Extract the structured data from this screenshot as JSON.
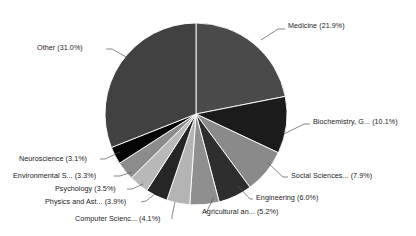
{
  "chart_data": {
    "type": "pie",
    "title": "",
    "subtitle": "",
    "xlabel": "",
    "ylabel": "",
    "legend_position": "none",
    "grid": false,
    "label_format": "{name} ({value}%)",
    "start_angle_deg": 0,
    "direction": "clockwise",
    "categories": [
      "Medicine",
      "Biochemistry, G...",
      "Social Sciences...",
      "Engineering",
      "Agricultural an...",
      "Computer Scienc...",
      "Physics and Ast...",
      "Psychology",
      "Environmental S...",
      "Neuroscience",
      "Other"
    ],
    "values": [
      21.9,
      10.1,
      7.9,
      6.0,
      5.2,
      4.1,
      3.9,
      3.5,
      3.3,
      3.1,
      31.0
    ],
    "colors": [
      "#4a4a4a",
      "#1b1b1b",
      "#8a8a8a",
      "#2e2e2e",
      "#8f8f8f",
      "#b4b4b4",
      "#262626",
      "#b9b9b9",
      "#8c8c8c",
      "#050505",
      "#414141"
    ],
    "slices": [
      {
        "name": "Medicine",
        "value": 21.9,
        "label": "Medicine (21.9%)",
        "color": "#4a4a4a",
        "label_x": 288,
        "label_y": 28,
        "anchor": "start",
        "leader": "261,40 278,29 285,29"
      },
      {
        "name": "Biochemistry, G...",
        "value": 10.1,
        "label": "Biochemistry, G... (10.1%)",
        "color": "#1b1b1b",
        "label_x": 313,
        "label_y": 124,
        "anchor": "start",
        "leader": "284,134 304,124 310,124"
      },
      {
        "name": "Social Sciences...",
        "value": 7.9,
        "label": "Social Sciences... (7.9%)",
        "color": "#8a8a8a",
        "label_x": 291,
        "label_y": 178,
        "anchor": "start",
        "leader": "268,163 283,177 288,177"
      },
      {
        "name": "Engineering",
        "value": 6.0,
        "label": "Engineering (6.0%)",
        "color": "#2e2e2e",
        "label_x": 256,
        "label_y": 200,
        "anchor": "start",
        "leader": "238,186 250,199 253,199"
      },
      {
        "name": "Agricultural an...",
        "value": 5.2,
        "label": "Agricultural an... (5.2%)",
        "color": "#8f8f8f",
        "label_x": 202,
        "label_y": 214,
        "anchor": "start",
        "leader": "214,197 207,211 205,213"
      },
      {
        "name": "Computer Scienc...",
        "value": 4.1,
        "label": "Computer Scienc... (4.1%)",
        "color": "#b4b4b4",
        "label_x": 75,
        "label_y": 221,
        "anchor": "start",
        "leader": "175,202 172,216 172,219"
      },
      {
        "name": "Physics and Ast...",
        "value": 3.9,
        "label": "Physics and Ast... (3.9%)",
        "color": "#262626",
        "label_x": 45,
        "label_y": 204,
        "anchor": "start",
        "leader": "155,194 146,201 141,202"
      },
      {
        "name": "Psychology",
        "value": 3.5,
        "label": "Psychology (3.5%)",
        "color": "#b9b9b9",
        "label_x": 55,
        "label_y": 191,
        "anchor": "start",
        "leader": "143,184 132,189 127,189"
      },
      {
        "name": "Environmental S...",
        "value": 3.3,
        "label": "Environmental S... (3.3%)",
        "color": "#8c8c8c",
        "label_x": 13,
        "label_y": 178,
        "anchor": "start",
        "leader": "132,172 120,176 114,176"
      },
      {
        "name": "Neuroscience",
        "value": 3.1,
        "label": "Neuroscience (3.1%)",
        "color": "#050505",
        "label_x": 19,
        "label_y": 161,
        "anchor": "start",
        "leader": "120,152 105,159 100,159"
      },
      {
        "name": "Other",
        "value": 31.0,
        "label": "Other (31.0%)",
        "color": "#414141",
        "label_x": 37,
        "label_y": 50,
        "anchor": "start",
        "leader": "128,58 112,49 106,49"
      }
    ],
    "geometry": {
      "center_x": 196,
      "center_y": 114,
      "radius": 91
    },
    "total": 100.0
  }
}
